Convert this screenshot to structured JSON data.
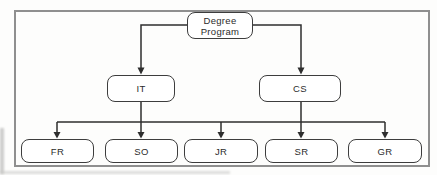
{
  "diagram": {
    "root": {
      "label": "Degree Program"
    },
    "branches": [
      {
        "label": "IT"
      },
      {
        "label": "CS"
      }
    ],
    "leaves": [
      {
        "label": "FR"
      },
      {
        "label": "SO"
      },
      {
        "label": "JR"
      },
      {
        "label": "SR"
      },
      {
        "label": "GR"
      }
    ],
    "colors": {
      "node_fill": "#ffffff",
      "node_border": "#3d3d3d",
      "connector": "#2e2e2e",
      "frame_border": "#8f8f8f",
      "text": "#2b2b2b"
    }
  }
}
